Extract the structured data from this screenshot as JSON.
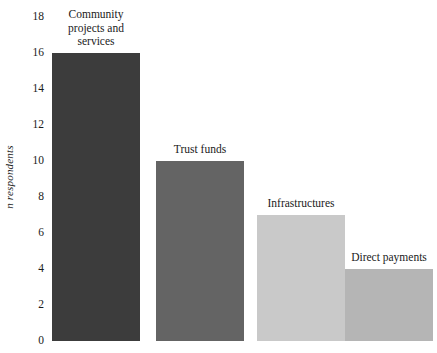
{
  "chart_data": {
    "type": "bar",
    "title": "",
    "subtitle": "",
    "xlabel": "",
    "ylabel": "n respondents",
    "ylim": [
      0,
      18
    ],
    "grid": false,
    "legend": "none",
    "yticks": [
      0,
      2,
      4,
      6,
      8,
      10,
      12,
      14,
      16,
      18
    ],
    "ytick_labels": [
      "0",
      "2",
      "4",
      "6",
      "8",
      "10",
      "12",
      "14",
      "16",
      "18"
    ],
    "categories": [
      "Community projects and services",
      "Trust funds",
      "Infrastructures",
      "Direct payments"
    ],
    "values": [
      16,
      10,
      7,
      4
    ],
    "bar_labels": [
      "Community\nprojects and\nservices",
      "Trust funds",
      "Infrastructures",
      "Direct payments"
    ],
    "bar_colors": [
      "#3c3c3c",
      "#646464",
      "#c9c9c9",
      "#b5b5b5"
    ]
  },
  "axis": {
    "y_label_text": "n respondents"
  }
}
